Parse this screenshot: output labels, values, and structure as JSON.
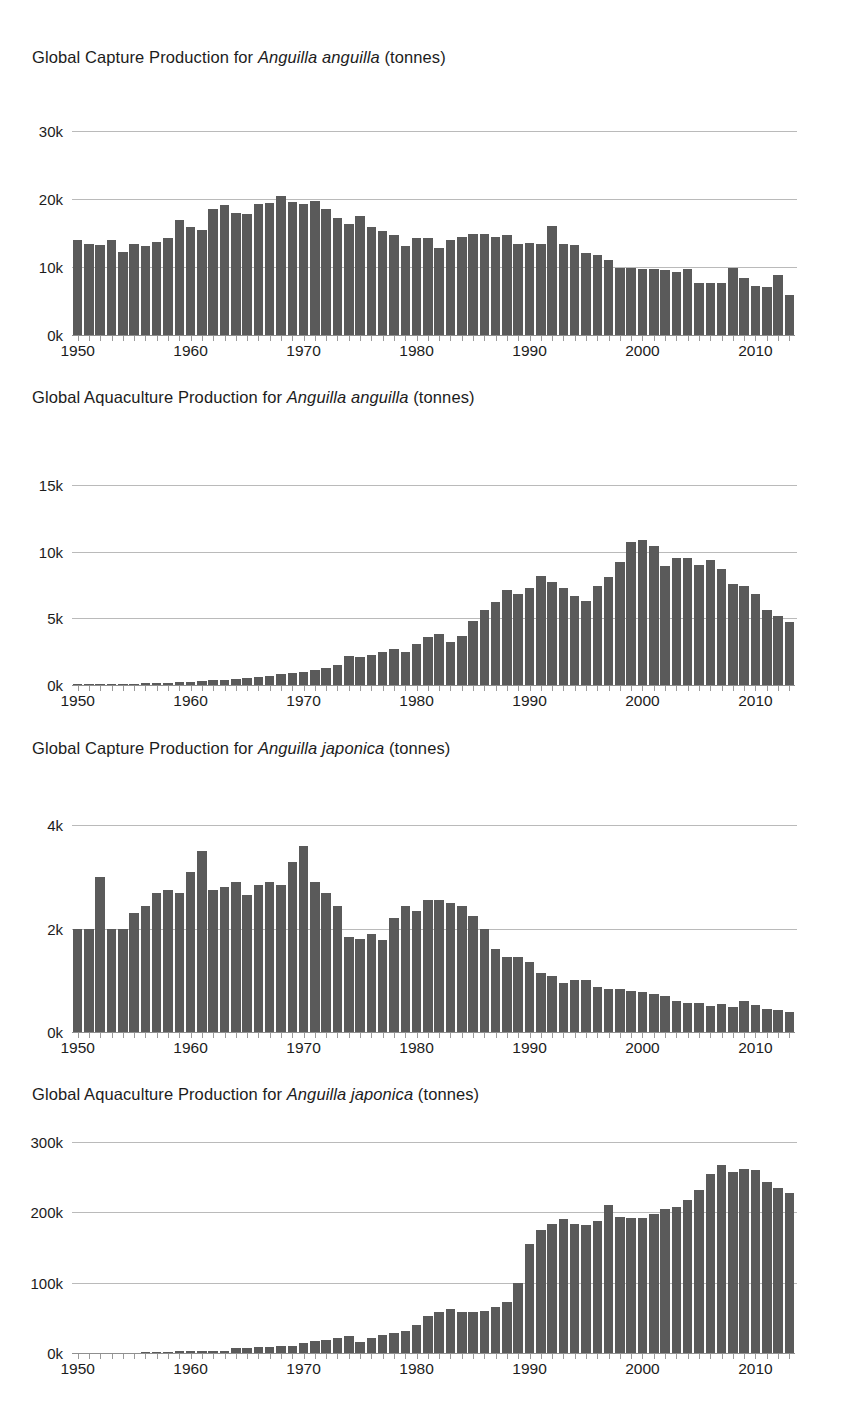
{
  "document": {
    "kind": "figure-sheet",
    "background_color": "#ffffff",
    "bar_color": "#5a5a5a",
    "gridline_color": "#b6b6b6"
  },
  "charts": [
    {
      "id": "capture-anguilla-anguilla",
      "title_prefix": "Global Capture Production for ",
      "title_species": "Anguilla anguilla",
      "title_suffix": " (tonnes)",
      "chart_data": {
        "type": "bar",
        "title": "Global Capture Production for Anguilla anguilla (tonnes)",
        "xlabel": "",
        "ylabel": "",
        "ylim": [
          0,
          32000
        ],
        "grid": true,
        "legend": "none",
        "ytick_values": [
          0,
          10000,
          20000,
          30000
        ],
        "ytick_labels": [
          "0k",
          "10k",
          "20k",
          "30k"
        ],
        "xtick_values": [
          1950,
          1960,
          1970,
          1980,
          1990,
          2000,
          2010
        ],
        "xtick_labels": [
          "1950",
          "1960",
          "1970",
          "1980",
          "1990",
          "2000",
          "2010"
        ],
        "x": [
          1950,
          1951,
          1952,
          1953,
          1954,
          1955,
          1956,
          1957,
          1958,
          1959,
          1960,
          1961,
          1962,
          1963,
          1964,
          1965,
          1966,
          1967,
          1968,
          1969,
          1970,
          1971,
          1972,
          1973,
          1974,
          1975,
          1976,
          1977,
          1978,
          1979,
          1980,
          1981,
          1982,
          1983,
          1984,
          1985,
          1986,
          1987,
          1988,
          1989,
          1990,
          1991,
          1992,
          1993,
          1994,
          1995,
          1996,
          1997,
          1998,
          1999,
          2000,
          2001,
          2002,
          2003,
          2004,
          2005,
          2006,
          2007,
          2008,
          2009,
          2010,
          2011,
          2012,
          2013
        ],
        "values": [
          14000,
          13300,
          13200,
          13900,
          12200,
          13400,
          13000,
          13700,
          14200,
          16900,
          15800,
          15400,
          18500,
          19100,
          17900,
          17700,
          19300,
          19400,
          20400,
          19500,
          19200,
          19600,
          18500,
          17200,
          16300,
          17500,
          15800,
          15200,
          14700,
          13000,
          14300,
          14300,
          12700,
          13900,
          14400,
          14800,
          14800,
          14400,
          14700,
          13400,
          13500,
          13400,
          16000,
          13300,
          13200,
          12100,
          11700,
          11000,
          9900,
          9800,
          9700,
          9700,
          9500,
          9200,
          9700,
          7700,
          7600,
          7600,
          9900,
          8300,
          7200,
          7000,
          8800,
          5900
        ]
      }
    },
    {
      "id": "aquaculture-anguilla-anguilla",
      "title_prefix": "Global Aquaculture Production for ",
      "title_species": "Anguilla anguilla",
      "title_suffix": " (tonnes)",
      "chart_data": {
        "type": "bar",
        "title": "Global Aquaculture Production for Anguilla anguilla (tonnes)",
        "xlabel": "",
        "ylabel": "",
        "ylim": [
          0,
          16500
        ],
        "grid": true,
        "legend": "none",
        "ytick_values": [
          0,
          5000,
          10000,
          15000
        ],
        "ytick_labels": [
          "0k",
          "5k",
          "10k",
          "15k"
        ],
        "xtick_values": [
          1950,
          1960,
          1970,
          1980,
          1990,
          2000,
          2010
        ],
        "xtick_labels": [
          "1950",
          "1960",
          "1970",
          "1980",
          "1990",
          "2000",
          "2010"
        ],
        "x": [
          1950,
          1951,
          1952,
          1953,
          1954,
          1955,
          1956,
          1957,
          1958,
          1959,
          1960,
          1961,
          1962,
          1963,
          1964,
          1965,
          1966,
          1967,
          1968,
          1969,
          1970,
          1971,
          1972,
          1973,
          1974,
          1975,
          1976,
          1977,
          1978,
          1979,
          1980,
          1981,
          1982,
          1983,
          1984,
          1985,
          1986,
          1987,
          1988,
          1989,
          1990,
          1991,
          1992,
          1993,
          1994,
          1995,
          1996,
          1997,
          1998,
          1999,
          2000,
          2001,
          2002,
          2003,
          2004,
          2005,
          2006,
          2007,
          2008,
          2009,
          2010,
          2011,
          2012,
          2013
        ],
        "values": [
          60,
          70,
          80,
          90,
          100,
          110,
          130,
          150,
          180,
          220,
          260,
          300,
          340,
          400,
          470,
          540,
          620,
          700,
          800,
          900,
          1000,
          1150,
          1300,
          1500,
          2200,
          2100,
          2250,
          2500,
          2700,
          2500,
          3100,
          3600,
          3800,
          3200,
          3700,
          4800,
          5600,
          6200,
          7100,
          6800,
          7300,
          8200,
          7700,
          7300,
          6700,
          6300,
          7400,
          8100,
          9200,
          10700,
          10900,
          10400,
          8900,
          9500,
          9500,
          9000,
          9400,
          8700,
          7600,
          7400,
          6800,
          5600,
          5200,
          4700
        ]
      }
    },
    {
      "id": "capture-anguilla-japonica",
      "title_prefix": "Global Capture Production for ",
      "title_species": "Anguilla japonica",
      "title_suffix": " (tonnes)",
      "chart_data": {
        "type": "bar",
        "title": "Global Capture Production for Anguilla japonica (tonnes)",
        "xlabel": "",
        "ylabel": "",
        "ylim": [
          0,
          4300
        ],
        "grid": true,
        "legend": "none",
        "ytick_values": [
          0,
          2000,
          4000
        ],
        "ytick_labels": [
          "0k",
          "2k",
          "4k"
        ],
        "xtick_values": [
          1950,
          1960,
          1970,
          1980,
          1990,
          2000,
          2010
        ],
        "xtick_labels": [
          "1950",
          "1960",
          "1970",
          "1980",
          "1990",
          "2000",
          "2010"
        ],
        "x": [
          1950,
          1951,
          1952,
          1953,
          1954,
          1955,
          1956,
          1957,
          1958,
          1959,
          1960,
          1961,
          1962,
          1963,
          1964,
          1965,
          1966,
          1967,
          1968,
          1969,
          1970,
          1971,
          1972,
          1973,
          1974,
          1975,
          1976,
          1977,
          1978,
          1979,
          1980,
          1981,
          1982,
          1983,
          1984,
          1985,
          1986,
          1987,
          1988,
          1989,
          1990,
          1991,
          1992,
          1993,
          1994,
          1995,
          1996,
          1997,
          1998,
          1999,
          2000,
          2001,
          2002,
          2003,
          2004,
          2005,
          2006,
          2007,
          2008,
          2009,
          2010,
          2011,
          2012,
          2013
        ],
        "values": [
          2000,
          1990,
          3000,
          2000,
          2000,
          2300,
          2450,
          2700,
          2750,
          2700,
          3100,
          3500,
          2750,
          2800,
          2900,
          2650,
          2850,
          2900,
          2850,
          3300,
          3600,
          2900,
          2700,
          2450,
          1850,
          1800,
          1900,
          1780,
          2200,
          2450,
          2350,
          2550,
          2550,
          2500,
          2450,
          2250,
          2000,
          1600,
          1450,
          1450,
          1350,
          1150,
          1080,
          950,
          1000,
          1000,
          870,
          830,
          830,
          800,
          770,
          730,
          690,
          600,
          570,
          560,
          510,
          540,
          490,
          600,
          530,
          450,
          430,
          380
        ]
      }
    },
    {
      "id": "aquaculture-anguilla-japonica",
      "title_prefix": "Global Aquaculture Production for ",
      "title_species": "Anguilla japonica",
      "title_suffix": " (tonnes)",
      "chart_data": {
        "type": "bar",
        "title": "Global Aquaculture Production for Anguilla japonica (tonnes)",
        "xlabel": "",
        "ylabel": "",
        "ylim": [
          0,
          320000
        ],
        "grid": true,
        "legend": "none",
        "ytick_values": [
          0,
          100000,
          200000,
          300000
        ],
        "ytick_labels": [
          "0k",
          "100k",
          "200k",
          "300k"
        ],
        "xtick_values": [
          1950,
          1960,
          1970,
          1980,
          1990,
          2000,
          2010
        ],
        "xtick_labels": [
          "1950",
          "1960",
          "1970",
          "1980",
          "1990",
          "2000",
          "2010"
        ],
        "x": [
          1950,
          1951,
          1952,
          1953,
          1954,
          1955,
          1956,
          1957,
          1958,
          1959,
          1960,
          1961,
          1962,
          1963,
          1964,
          1965,
          1966,
          1967,
          1968,
          1969,
          1970,
          1971,
          1972,
          1973,
          1974,
          1975,
          1976,
          1977,
          1978,
          1979,
          1980,
          1981,
          1982,
          1983,
          1984,
          1985,
          1986,
          1987,
          1988,
          1989,
          1990,
          1991,
          1992,
          1993,
          1994,
          1995,
          1996,
          1997,
          1998,
          1999,
          2000,
          2001,
          2002,
          2003,
          2004,
          2005,
          2006,
          2007,
          2008,
          2009,
          2010,
          2011,
          2012,
          2013
        ],
        "values": [
          0,
          0,
          0,
          0,
          0,
          0,
          1500,
          2000,
          2000,
          2200,
          2500,
          2600,
          2700,
          3500,
          6500,
          6500,
          8500,
          9000,
          9500,
          10500,
          14500,
          16500,
          19000,
          21500,
          24000,
          16000,
          22000,
          25000,
          28000,
          32000,
          40000,
          52000,
          58000,
          62000,
          59000,
          58000,
          60000,
          65000,
          72000,
          100000,
          155000,
          175000,
          183000,
          190000,
          183000,
          182000,
          188000,
          210000,
          193000,
          192000,
          192000,
          197000,
          205000,
          208000,
          218000,
          232000,
          255000,
          268000,
          258000,
          262000,
          260000,
          243000,
          235000,
          228000
        ]
      }
    }
  ]
}
